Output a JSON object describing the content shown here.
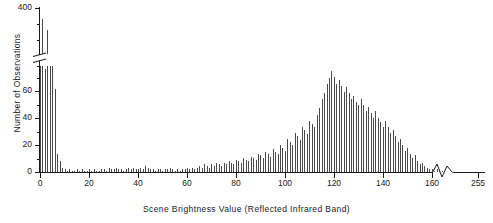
{
  "chart_data": {
    "type": "bar",
    "title": "",
    "xlabel": "Scene Brightness Value (Reflected Infrared Band)",
    "ylabel": "Number of Observations",
    "xlim": [
      0,
      165
    ],
    "ylim": [
      0,
      70
    ],
    "ylim_upper": [
      380,
      410
    ],
    "grid": false,
    "legend": null,
    "axis_breaks": {
      "y_break_between": [
        70,
        380
      ],
      "x_break_between": [
        165,
        250
      ],
      "x_extra_tick": 255
    },
    "xticks": [
      0,
      20,
      40,
      60,
      80,
      100,
      120,
      140,
      160,
      255
    ],
    "yticks_lower": [
      0,
      20,
      40,
      60
    ],
    "yticks_upper": [
      400
    ],
    "categories": [
      0,
      1,
      2,
      3,
      4,
      5,
      6,
      7,
      8,
      9,
      10,
      11,
      12,
      13,
      14,
      15,
      16,
      17,
      18,
      19,
      20,
      21,
      22,
      23,
      24,
      25,
      26,
      27,
      28,
      29,
      30,
      31,
      32,
      33,
      34,
      35,
      36,
      37,
      38,
      39,
      40,
      41,
      42,
      43,
      44,
      45,
      46,
      47,
      48,
      49,
      50,
      51,
      52,
      53,
      54,
      55,
      56,
      57,
      58,
      59,
      60,
      61,
      62,
      63,
      64,
      65,
      66,
      67,
      68,
      69,
      70,
      71,
      72,
      73,
      74,
      75,
      76,
      77,
      78,
      79,
      80,
      81,
      82,
      83,
      84,
      85,
      86,
      87,
      88,
      89,
      90,
      91,
      92,
      93,
      94,
      95,
      96,
      97,
      98,
      99,
      100,
      101,
      102,
      103,
      104,
      105,
      106,
      107,
      108,
      109,
      110,
      111,
      112,
      113,
      114,
      115,
      116,
      117,
      118,
      119,
      120,
      121,
      122,
      123,
      124,
      125,
      126,
      127,
      128,
      129,
      130,
      131,
      132,
      133,
      134,
      135,
      136,
      137,
      138,
      139,
      140,
      141,
      142,
      143,
      144,
      145,
      146,
      147,
      148,
      149,
      150,
      151,
      152,
      153,
      154,
      155,
      156,
      157,
      158,
      159,
      160,
      161,
      162,
      163,
      164
    ],
    "values": [
      70,
      402,
      68,
      395,
      330,
      268,
      55,
      12,
      7,
      3,
      2,
      1,
      2,
      1,
      1,
      2,
      1,
      2,
      1,
      1,
      2,
      1,
      2,
      1,
      1,
      2,
      2,
      1,
      3,
      2,
      2,
      3,
      2,
      2,
      1,
      2,
      3,
      2,
      3,
      2,
      2,
      3,
      2,
      4,
      3,
      2,
      2,
      1,
      2,
      2,
      1,
      2,
      2,
      3,
      2,
      1,
      2,
      1,
      2,
      2,
      3,
      2,
      3,
      2,
      3,
      4,
      3,
      5,
      4,
      3,
      5,
      4,
      6,
      5,
      4,
      6,
      5,
      7,
      6,
      5,
      8,
      7,
      6,
      9,
      8,
      7,
      10,
      9,
      8,
      12,
      11,
      9,
      13,
      12,
      10,
      15,
      13,
      12,
      18,
      16,
      14,
      22,
      20,
      18,
      26,
      24,
      21,
      30,
      28,
      25,
      34,
      32,
      30,
      38,
      42,
      48,
      52,
      58,
      62,
      67,
      63,
      58,
      61,
      57,
      53,
      56,
      52,
      48,
      50,
      46,
      44,
      48,
      44,
      40,
      43,
      39,
      36,
      40,
      36,
      33,
      30,
      34,
      30,
      26,
      28,
      24,
      20,
      22,
      18,
      14,
      16,
      12,
      9,
      11,
      7,
      5,
      6,
      4,
      3,
      2,
      2,
      1,
      2,
      1,
      1
    ],
    "note_bars_above_break": {
      "indices": [
        1,
        3,
        4,
        5
      ],
      "values": [
        402,
        395,
        330,
        268
      ]
    }
  },
  "axis": {
    "y_label_text": "Number of Observations",
    "x_label_text": "Scene Brightness Value (Reflected Infrared Band)",
    "ytick_400": "400",
    "ytick_60": "60",
    "ytick_40": "40",
    "ytick_20": "20",
    "ytick_0": "0",
    "xtick_0": "0",
    "xtick_20": "20",
    "xtick_40": "40",
    "xtick_60": "60",
    "xtick_80": "80",
    "xtick_100": "100",
    "xtick_120": "120",
    "xtick_140": "140",
    "xtick_160": "160",
    "xtick_255": "255"
  },
  "colors": {
    "bar": "#4a4a4a",
    "axis": "#1a1a1a",
    "background": "#ffffff"
  }
}
